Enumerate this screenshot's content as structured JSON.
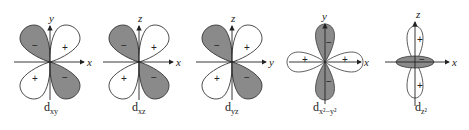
{
  "figure": {
    "panels": [
      {
        "id": "dxy",
        "orbital": "d",
        "subscript": "xy",
        "horizontal_axis": "x",
        "vertical_axis": "y",
        "lobes": [
          {
            "position": "upper-left",
            "sign": "−"
          },
          {
            "position": "upper-right",
            "sign": "+"
          },
          {
            "position": "lower-left",
            "sign": "+"
          },
          {
            "position": "lower-right",
            "sign": "−"
          }
        ]
      },
      {
        "id": "dxz",
        "orbital": "d",
        "subscript": "xz",
        "horizontal_axis": "x",
        "vertical_axis": "z",
        "lobes": [
          {
            "position": "upper-left",
            "sign": "−"
          },
          {
            "position": "upper-right",
            "sign": "+"
          },
          {
            "position": "lower-left",
            "sign": "+"
          },
          {
            "position": "lower-right",
            "sign": "−"
          }
        ]
      },
      {
        "id": "dyz",
        "orbital": "d",
        "subscript": "yz",
        "horizontal_axis": "y",
        "vertical_axis": "z",
        "lobes": [
          {
            "position": "upper-left",
            "sign": "−"
          },
          {
            "position": "upper-right",
            "sign": "+"
          },
          {
            "position": "lower-left",
            "sign": "+"
          },
          {
            "position": "lower-right",
            "sign": "−"
          }
        ]
      },
      {
        "id": "dx2y2",
        "orbital": "d",
        "subscript": "x²−y²",
        "horizontal_axis": "x",
        "vertical_axis": "y",
        "lobes": [
          {
            "position": "up",
            "sign": "−"
          },
          {
            "position": "down",
            "sign": "−"
          },
          {
            "position": "left",
            "sign": "+"
          },
          {
            "position": "right",
            "sign": "+"
          }
        ]
      },
      {
        "id": "dz2",
        "orbital": "d",
        "subscript": "z²",
        "horizontal_axis": "x",
        "vertical_axis": "z",
        "lobes": [
          {
            "position": "up",
            "sign": "+"
          },
          {
            "position": "down",
            "sign": "+"
          },
          {
            "position": "torus",
            "sign": "−"
          }
        ]
      }
    ],
    "colors": {
      "negative_lobe": "#8a8a8a",
      "positive_lobe": "#ffffff",
      "axis": "#222222"
    }
  }
}
